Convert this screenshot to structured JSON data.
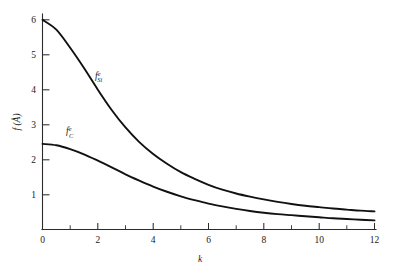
{
  "figure": {
    "background_color": "#ffffff",
    "ink_color": "#111111",
    "width": 401,
    "height": 274
  },
  "chart_data": {
    "type": "line",
    "title": "",
    "subtitle": "",
    "xlabel": "k",
    "ylabel": "f (Å)",
    "xlim": [
      0,
      12.6
    ],
    "ylim": [
      0,
      6.45
    ],
    "grid": false,
    "legend_position": "inline-annotation",
    "x_ticks_major": [
      0,
      2,
      4,
      6,
      8,
      10,
      12
    ],
    "x_ticks_major_labels": [
      "0",
      "2",
      "4",
      "6",
      "8",
      "10",
      "12"
    ],
    "x_ticks_minor": [
      1,
      3,
      5,
      7,
      9,
      11
    ],
    "y_ticks_major": [
      1,
      2,
      3,
      4,
      5,
      6
    ],
    "y_ticks_major_labels": [
      "1",
      "2",
      "3",
      "4",
      "5",
      "6"
    ],
    "x": [
      0,
      0.5,
      1,
      1.5,
      2,
      2.5,
      3,
      3.5,
      4,
      4.5,
      5,
      5.5,
      6,
      6.5,
      7,
      7.5,
      8,
      8.5,
      9,
      9.5,
      10,
      10.5,
      11,
      11.5,
      12
    ],
    "series": [
      {
        "name": "f_Si_e",
        "label_base": "f",
        "label_superscript": "e",
        "label_subscript": "Si",
        "color": "#111111",
        "values": [
          6.0,
          5.72,
          5.2,
          4.62,
          4.0,
          3.42,
          2.92,
          2.5,
          2.16,
          1.88,
          1.64,
          1.45,
          1.28,
          1.14,
          1.03,
          0.94,
          0.86,
          0.79,
          0.73,
          0.68,
          0.64,
          0.6,
          0.57,
          0.54,
          0.52
        ],
        "annotation_x": 1.9,
        "annotation_y": 4.3
      },
      {
        "name": "f_C_e",
        "label_base": "f",
        "label_superscript": "e",
        "label_subscript": "C",
        "color": "#111111",
        "values": [
          2.45,
          2.41,
          2.3,
          2.15,
          1.97,
          1.78,
          1.58,
          1.4,
          1.23,
          1.08,
          0.95,
          0.84,
          0.74,
          0.66,
          0.59,
          0.53,
          0.48,
          0.44,
          0.41,
          0.38,
          0.35,
          0.32,
          0.3,
          0.28,
          0.26
        ],
        "annotation_x": 0.85,
        "annotation_y": 2.72
      }
    ]
  },
  "labels": {
    "x_axis": "k",
    "y_axis_text": "f (Å)",
    "y_axis_base": "f",
    "y_axis_paren_open": " (",
    "y_axis_unit": "Å",
    "y_axis_paren_close": ")"
  }
}
